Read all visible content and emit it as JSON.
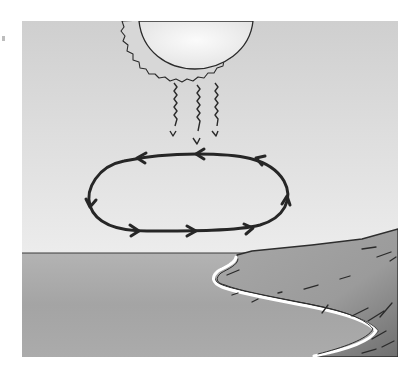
{
  "illustration": {
    "subject": "sea-breeze-convection-diagram",
    "elements": {
      "sun": "sun-icon",
      "radiation": "heat-radiation-arrows",
      "circulation": "convection-loop",
      "sea": "sea",
      "land": "land",
      "shoreline": "shoreline"
    },
    "colors": {
      "sky_light": "#e6e6e6",
      "sky_dark": "#c8c8c8",
      "sun_fill": "#f2f2f2",
      "sun_corona": "#d4d4d4",
      "sea": "#a9a9a9",
      "land": "#9a9a9a",
      "land_dark": "#7d7d7d",
      "shore_foam": "#ffffff",
      "ink": "#2a2a2a"
    },
    "arrow_directions": {
      "top_edge": "right-to-left",
      "left_edge": "downward",
      "bottom_edge": "left-to-right",
      "right_edge": "upward"
    }
  }
}
